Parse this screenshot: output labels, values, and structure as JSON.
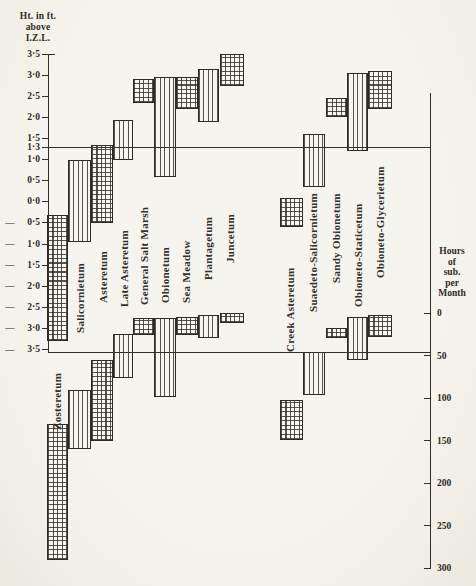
{
  "left_axis": {
    "title_lines": [
      "Ht. in ft.",
      "above",
      "I.Z.L."
    ],
    "ticks": [
      {
        "label": "3·5",
        "value": 3.5,
        "minus": false
      },
      {
        "label": "3·0",
        "value": 3.0,
        "minus": false
      },
      {
        "label": "2·5",
        "value": 2.5,
        "minus": false
      },
      {
        "label": "2·0",
        "value": 2.0,
        "minus": false
      },
      {
        "label": "1·5",
        "value": 1.5,
        "minus": false
      },
      {
        "label": "1·3",
        "value": 1.3,
        "minus": false
      },
      {
        "label": "1·0",
        "value": 1.0,
        "minus": false
      },
      {
        "label": "0·5",
        "value": 0.5,
        "minus": false
      },
      {
        "label": "0·0",
        "value": 0.0,
        "minus": false
      },
      {
        "label": "0·5",
        "value": -0.5,
        "minus": true
      },
      {
        "label": "1·0",
        "value": -1.0,
        "minus": true
      },
      {
        "label": "1·5",
        "value": -1.5,
        "minus": true
      },
      {
        "label": "2·0",
        "value": -2.0,
        "minus": true
      },
      {
        "label": "2·5",
        "value": -2.5,
        "minus": true
      },
      {
        "label": "3·0",
        "value": -3.0,
        "minus": true
      },
      {
        "label": "3·5",
        "value": -3.5,
        "minus": true
      }
    ]
  },
  "right_axis": {
    "title_lines": [
      "Hours",
      "of",
      "sub.",
      "per",
      "Month"
    ],
    "ticks": [
      {
        "label": "0",
        "value": 0
      },
      {
        "label": "50",
        "value": 50
      },
      {
        "label": "100",
        "value": 100
      },
      {
        "label": "150",
        "value": 150
      },
      {
        "label": "200",
        "value": 200
      },
      {
        "label": "250",
        "value": 250
      },
      {
        "label": "300",
        "value": 300
      }
    ]
  },
  "chart_data": {
    "type": "bar",
    "variant": "dual floating range bars (height range + submergence range) per plant community",
    "title": "",
    "height_axis": {
      "title": "Ht. in ft. above I.Z.L.",
      "tick_values": [
        3.5,
        3.0,
        2.5,
        2.0,
        1.5,
        1.3,
        1.0,
        0.5,
        0.0,
        -0.5,
        -1.0,
        -1.5,
        -2.0,
        -2.5,
        -3.0,
        -3.5
      ],
      "range": [
        3.5,
        -3.5
      ],
      "reference_lines_ft": [
        1.3,
        -3.5
      ]
    },
    "hours_axis": {
      "title": "Hours of sub. per Month",
      "tick_values": [
        0,
        50,
        100,
        150,
        200,
        250,
        300
      ],
      "range": [
        0,
        300
      ]
    },
    "series": [
      {
        "name": "Zosteretum",
        "hatch": "cross",
        "height_ft": [
          -0.3,
          -3.3
        ],
        "hours_per_month": [
          130,
          290
        ]
      },
      {
        "name": "Salicornietum",
        "hatch": "vertical",
        "height_ft": [
          1.0,
          -0.95
        ],
        "hours_per_month": [
          90,
          160
        ]
      },
      {
        "name": "Asteretum",
        "hatch": "cross",
        "height_ft": [
          1.35,
          -0.5
        ],
        "hours_per_month": [
          55,
          150
        ]
      },
      {
        "name": "Late Asteretum",
        "hatch": "vertical",
        "height_ft": [
          1.95,
          1.0
        ],
        "hours_per_month": [
          25,
          77
        ]
      },
      {
        "name": "General Salt Marsh",
        "hatch": "cross",
        "height_ft": [
          2.9,
          2.35
        ],
        "hours_per_month": [
          6,
          26
        ]
      },
      {
        "name": "Obionetum",
        "hatch": "vertical",
        "height_ft": [
          2.95,
          0.6
        ],
        "hours_per_month": [
          6,
          99
        ]
      },
      {
        "name": "Sea Meadow",
        "hatch": "cross",
        "height_ft": [
          2.95,
          2.2
        ],
        "hours_per_month": [
          5,
          26
        ]
      },
      {
        "name": "Plantagetum",
        "hatch": "vertical",
        "height_ft": [
          3.15,
          1.9
        ],
        "hours_per_month": [
          2,
          29
        ]
      },
      {
        "name": "Juncetum",
        "hatch": "cross",
        "height_ft": [
          3.5,
          2.75
        ],
        "hours_per_month": [
          0,
          12
        ]
      },
      {
        "name": "Creek Asteretum",
        "hatch": "cross",
        "height_ft": [
          0.1,
          -0.6
        ],
        "hours_per_month": [
          102,
          150
        ]
      },
      {
        "name": "Suaedeto-Salicornietum",
        "hatch": "vertical",
        "height_ft": [
          1.6,
          0.35
        ],
        "hours_per_month": [
          46,
          96
        ]
      },
      {
        "name": "Sandy Obionetum",
        "hatch": "cross",
        "height_ft": [
          2.45,
          2.0
        ],
        "hours_per_month": [
          18,
          30
        ]
      },
      {
        "name": "Obioneto-Staticetum",
        "hatch": "vertical",
        "height_ft": [
          3.05,
          1.2
        ],
        "hours_per_month": [
          5,
          55
        ]
      },
      {
        "name": "Obioneto-Glycerietum",
        "hatch": "cross",
        "height_ft": [
          3.1,
          2.2
        ],
        "hours_per_month": [
          2,
          28
        ]
      }
    ]
  },
  "colors": {
    "ink": "#332f28",
    "paper": "#f6f4ee"
  }
}
